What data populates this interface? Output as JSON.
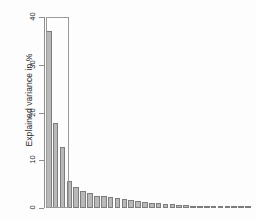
{
  "chart_data": {
    "type": "bar",
    "title": "",
    "subtitle": "",
    "xlabel": "",
    "ylabel": "Explained variance in %",
    "ylim": [
      0,
      40
    ],
    "yticks": [
      0,
      10,
      20,
      30,
      40
    ],
    "ytick_labels": [
      "0",
      "10",
      "20",
      "30",
      "40"
    ],
    "grid": false,
    "legend": null,
    "categories": [
      "PC1",
      "PC2",
      "PC3",
      "PC4",
      "PC5",
      "PC6",
      "PC7",
      "PC8",
      "PC9",
      "PC10",
      "PC11",
      "PC12",
      "PC13",
      "PC14",
      "PC15",
      "PC16",
      "PC17",
      "PC18",
      "PC19",
      "PC20",
      "PC21",
      "PC22",
      "PC23",
      "PC24",
      "PC25",
      "PC26",
      "PC27",
      "PC28",
      "PC29",
      "PC30"
    ],
    "values": [
      37.0,
      17.8,
      12.7,
      5.6,
      4.4,
      3.5,
      3.2,
      2.6,
      2.5,
      2.3,
      2.0,
      1.8,
      1.6,
      1.4,
      1.2,
      1.1,
      0.95,
      0.85,
      0.75,
      0.65,
      0.55,
      0.5,
      0.45,
      0.4,
      0.35,
      0.3,
      0.28,
      0.25,
      0.22,
      0.2
    ],
    "bar_fill_color": "#b9b9b9",
    "bar_edge_color": "#7d7d7d",
    "axis_color": "#8e8e8e",
    "background_color": "#ffffff",
    "annotations": [
      {
        "name": "selected-components-box",
        "type": "rectangle",
        "covers_categories": [
          "PC1",
          "PC2",
          "PC3"
        ],
        "y_top": 40,
        "y_bottom": 0,
        "edge_color": "#9a9a9a"
      }
    ]
  }
}
